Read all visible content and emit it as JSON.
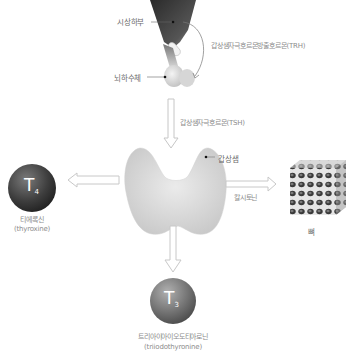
{
  "diagram": {
    "title": "",
    "nodes": {
      "hypothalamus": {
        "label": "시상하부"
      },
      "pituitary": {
        "label": "뇌하수체"
      },
      "thyroid": {
        "label": "갑상샘"
      },
      "bone": {
        "label": "뼈"
      },
      "t4": {
        "symbol": "T",
        "subscript": "4",
        "label_ko": "티에록신",
        "label_en": "(thyroxine)"
      },
      "t3": {
        "symbol": "T",
        "subscript": "3",
        "label_ko": "트리아이아이오도티아로닌",
        "label_en": "(triiodothyronine)"
      }
    },
    "edges": {
      "trh": {
        "label": "갑상샘자극호르몬방출호르몬(TRH)",
        "from": "hypothalamus",
        "to": "pituitary"
      },
      "tsh": {
        "label": "갑상샘자극호르몬(TSH)",
        "from": "pituitary",
        "to": "thyroid"
      },
      "calcitonin": {
        "label": "칼시토닌",
        "from": "thyroid",
        "to": "bone"
      },
      "to_t4": {
        "from": "thyroid",
        "to": "t4"
      },
      "to_t3": {
        "from": "thyroid",
        "to": "t3"
      }
    },
    "colors": {
      "sphere_dark": "#3a3a3a",
      "sphere_mid": "#6e6e6e",
      "arrow_stroke": "#c8c8c8",
      "gland": "#d6d6d6",
      "hypothalamus": "#3c3c3c"
    }
  }
}
